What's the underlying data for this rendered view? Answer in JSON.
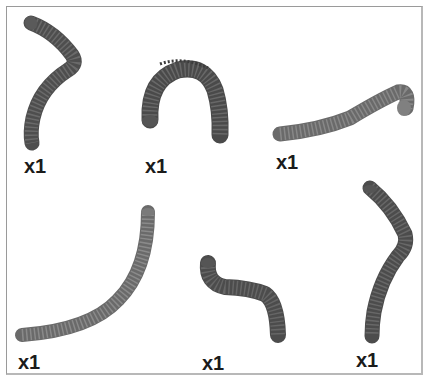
{
  "diagram": {
    "type": "parts-list",
    "colors": {
      "frame": "#9a9a9a",
      "hose_dark": "#4a4a4a",
      "hose_mid": "#5e5e5e",
      "hose_light": "#777777",
      "ridge": "#3a3a3a",
      "label": "#1b1b1b"
    },
    "parts": [
      {
        "id": "hose-1",
        "shape": "bent-hook",
        "quantity": "x1"
      },
      {
        "id": "hose-2",
        "shape": "arch",
        "quantity": "x1"
      },
      {
        "id": "hose-3",
        "shape": "long-curve-horizontal",
        "quantity": "x1"
      },
      {
        "id": "hose-4",
        "shape": "long-quarter-arc",
        "quantity": "x1"
      },
      {
        "id": "hose-5",
        "shape": "s-bend",
        "quantity": "x1"
      },
      {
        "id": "hose-6",
        "shape": "tall-wavy",
        "quantity": "x1"
      }
    ]
  }
}
